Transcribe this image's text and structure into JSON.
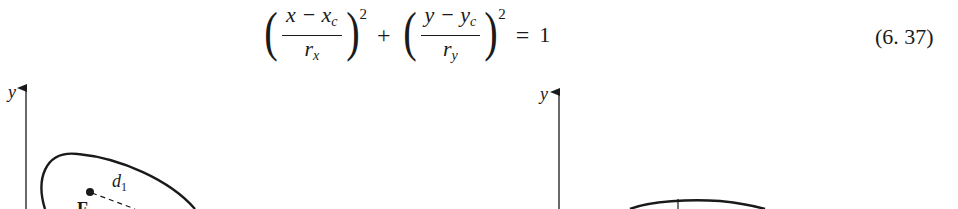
{
  "equation": {
    "term1": {
      "numerator": "x − x",
      "numerator_sub": "c",
      "denominator": "r",
      "denominator_sub": "x",
      "exponent": "2"
    },
    "plus": "+",
    "term2": {
      "numerator": "y − y",
      "numerator_sub": "c",
      "denominator": "r",
      "denominator_sub": "y",
      "exponent": "2"
    },
    "equals": "=",
    "rhs": "1",
    "number": "(6. 37)",
    "open_paren": "(",
    "close_paren": ")"
  },
  "figure_left": {
    "axis_label_y": "y",
    "distance_label": "d",
    "distance_label_sub": "1",
    "focus_label": "F"
  },
  "figure_right": {
    "axis_label_y": "y"
  }
}
